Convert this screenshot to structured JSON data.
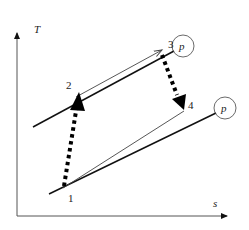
{
  "diagram": {
    "type": "T-s diagram (Brayton cycle)",
    "axes": {
      "y_label": "T",
      "x_label": "s"
    },
    "isobars": [
      {
        "id": "high-pressure",
        "label": "p"
      },
      {
        "id": "low-pressure",
        "label": "p"
      }
    ],
    "states": [
      {
        "id": "1",
        "label": "1"
      },
      {
        "id": "2",
        "label": "2"
      },
      {
        "id": "3",
        "label": "3"
      },
      {
        "id": "4",
        "label": "4"
      }
    ],
    "processes": [
      {
        "from": "1",
        "to": "2",
        "style": "thick-dotted-arrow"
      },
      {
        "from": "2",
        "to": "3",
        "style": "thin-arrow"
      },
      {
        "from": "3",
        "to": "4",
        "style": "thick-dotted-arrow"
      },
      {
        "from": "1",
        "to": "4",
        "style": "thin-line"
      }
    ],
    "colors": {
      "line": "#111111",
      "thin_line": "#555555"
    }
  }
}
